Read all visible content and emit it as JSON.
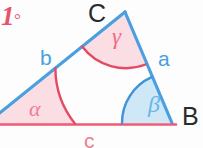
{
  "diagram": {
    "corner_marker": {
      "number": "1",
      "degree_symbol": "°",
      "color": "#e8536b"
    },
    "colors": {
      "side_blue": "#4a9fe0",
      "side_red": "#ef5a74",
      "angle_fill_pink": "#fbdde4",
      "angle_fill_blue": "#cfe8f7",
      "arc_red": "#e34b63",
      "arc_blue": "#3f93d8",
      "label_blue": "#4a9fe0",
      "label_pink": "#ee7d92",
      "label_red": "#e8536b",
      "vertex_black": "#2b2b2b",
      "background": "#fdfdfd"
    },
    "vertices": [
      {
        "name": "C",
        "label": "C",
        "x": 125,
        "y": 12
      },
      {
        "name": "B",
        "label": "B",
        "x": 172,
        "y": 123
      },
      {
        "name": "A",
        "label": "",
        "x": -14,
        "y": 124
      }
    ],
    "sides": [
      {
        "name": "a",
        "label": "a",
        "from": "C",
        "to": "B",
        "color": "#4a9fe0"
      },
      {
        "name": "b",
        "label": "b",
        "from": "A",
        "to": "C",
        "color": "#4a9fe0"
      },
      {
        "name": "c",
        "label": "c",
        "from": "A",
        "to": "B",
        "color": "#ef5a74"
      }
    ],
    "angles": [
      {
        "name": "alpha",
        "label": "α",
        "at_vertex": "A",
        "fill": "#fbdde4",
        "arc": "#e34b63"
      },
      {
        "name": "beta",
        "label": "β",
        "at_vertex": "B",
        "fill": "#cfe8f7",
        "arc": "#3f93d8"
      },
      {
        "name": "gamma",
        "label": "γ",
        "at_vertex": "C",
        "fill": "#fbdde4",
        "arc": "#e34b63"
      }
    ]
  }
}
